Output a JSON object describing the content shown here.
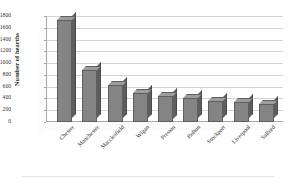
{
  "chart_data": {
    "type": "bar",
    "title": "",
    "xlabel": "",
    "ylabel": "Number of hearths",
    "ylim": [
      0,
      1800
    ],
    "ytick_step": 200,
    "yticks": [
      "1800",
      "1600",
      "1400",
      "1200",
      "1000",
      "800",
      "600",
      "400",
      "200",
      "0"
    ],
    "grid": true,
    "legend": "none",
    "style": "3-D clustered column, grayscale",
    "categories": [
      "Chester",
      "Manchester",
      "Macclesfield",
      "Wigan",
      "Preston",
      "Bolton",
      "Stockport",
      "Liverpool",
      "Salford"
    ],
    "values": [
      1740,
      880,
      630,
      490,
      450,
      410,
      350,
      345,
      300
    ],
    "series": [
      {
        "name": "Number of hearths",
        "values": [
          1740,
          880,
          630,
          490,
          450,
          410,
          350,
          345,
          300
        ]
      }
    ]
  },
  "colors": {
    "bar_front": "#848484",
    "bar_side": "#5e5e5e",
    "bar_top": "#9d9d9d",
    "bar_outline": "#5f5f5f",
    "gridline": "#d4d4d4",
    "axis": "#a9a9a9",
    "text": "#2f2f2f",
    "background": "#ffffff"
  }
}
